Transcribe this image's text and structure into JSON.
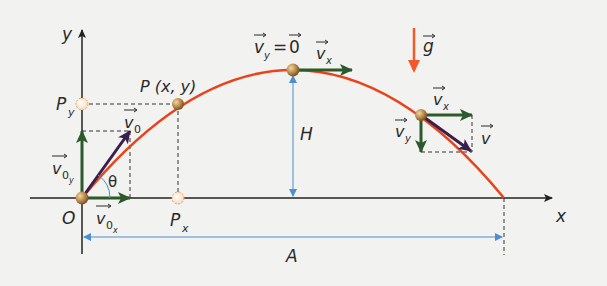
{
  "diagram": {
    "axes": {
      "x_label": "x",
      "y_label": "y",
      "origin_label": "O"
    },
    "point": {
      "label": "P (x, y)",
      "proj_y_label": "P",
      "proj_y_sub": "y",
      "proj_x_label": "P",
      "proj_x_sub": "x"
    },
    "launch": {
      "v0_label": "v",
      "v0_sub": "0",
      "v0y_label": "v",
      "v0y_sub": "0",
      "v0y_subsub": "y",
      "v0x_label": "v",
      "v0x_sub": "0",
      "v0x_subsub": "x",
      "angle_label": "θ"
    },
    "apex": {
      "vy_label": "v",
      "vy_sub": "y",
      "equals": "=",
      "zero_label": "0",
      "vx_label": "v",
      "vx_sub": "x"
    },
    "descent": {
      "vx_label": "v",
      "vx_sub": "x",
      "vy_label": "v",
      "vy_sub": "y",
      "v_label": "v"
    },
    "gravity_label": "g",
    "height_label": "H",
    "range_label": "A",
    "colors": {
      "trajectory": "#e8431c",
      "component_vector": "#2d5a2a",
      "velocity_vector": "#3a1f4a",
      "dimension_line": "#4a8fd0",
      "gravity": "#f05a28",
      "axis": "#222222",
      "ball": "#b8894a"
    }
  }
}
